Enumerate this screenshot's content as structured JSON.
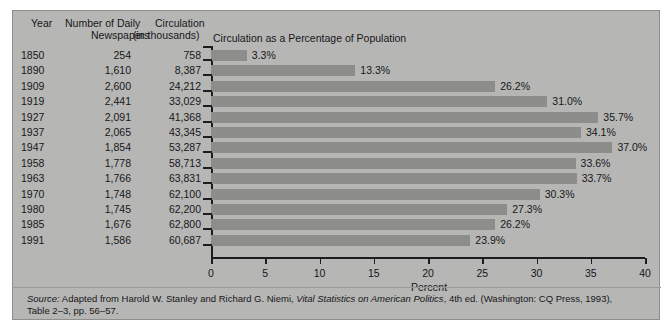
{
  "table": {
    "headers": {
      "year": "Year",
      "newspapers_line1": "Number of Daily",
      "newspapers_line2": "Newspapers",
      "circulation_line1": "Circulation",
      "circulation_line2": "(in thousands)"
    },
    "rows": [
      {
        "year": "1850",
        "newspapers": "254",
        "circulation": "758"
      },
      {
        "year": "1890",
        "newspapers": "1,610",
        "circulation": "8,387"
      },
      {
        "year": "1909",
        "newspapers": "2,600",
        "circulation": "24,212"
      },
      {
        "year": "1919",
        "newspapers": "2,441",
        "circulation": "33,029"
      },
      {
        "year": "1927",
        "newspapers": "2,091",
        "circulation": "41,368"
      },
      {
        "year": "1937",
        "newspapers": "2,065",
        "circulation": "43,345"
      },
      {
        "year": "1947",
        "newspapers": "1,854",
        "circulation": "53,287"
      },
      {
        "year": "1958",
        "newspapers": "1,778",
        "circulation": "58,713"
      },
      {
        "year": "1963",
        "newspapers": "1,766",
        "circulation": "63,831"
      },
      {
        "year": "1970",
        "newspapers": "1,748",
        "circulation": "62,100"
      },
      {
        "year": "1980",
        "newspapers": "1,745",
        "circulation": "62,200"
      },
      {
        "year": "1985",
        "newspapers": "1,676",
        "circulation": "62,800"
      },
      {
        "year": "1991",
        "newspapers": "1,586",
        "circulation": "60,687"
      }
    ]
  },
  "chart_data": {
    "type": "bar",
    "orientation": "horizontal",
    "title": "Circulation as a Percentage of Population",
    "xlabel": "Percent",
    "ylabel": "",
    "xlim": [
      0,
      40
    ],
    "xticks": [
      0,
      5,
      10,
      15,
      20,
      25,
      30,
      35,
      40
    ],
    "xticklabels": [
      "0",
      "5",
      "10",
      "15",
      "20",
      "25",
      "30",
      "35",
      "40"
    ],
    "grid": false,
    "legend": null,
    "bar_color": "#8d8d8b",
    "categories": [
      "1850",
      "1890",
      "1909",
      "1919",
      "1927",
      "1937",
      "1947",
      "1958",
      "1963",
      "1970",
      "1980",
      "1985",
      "1991"
    ],
    "values": [
      3.3,
      13.3,
      26.2,
      31.0,
      35.7,
      34.1,
      37.0,
      33.6,
      33.7,
      30.3,
      27.3,
      26.2,
      23.9
    ],
    "value_labels": [
      "3.3%",
      "13.3%",
      "26.2%",
      "31.0%",
      "35.7%",
      "34.1%",
      "37.0%",
      "33.6%",
      "33.7%",
      "30.3%",
      "27.3%",
      "26.2%",
      "23.9%"
    ]
  },
  "source": {
    "label": "Source:",
    "text_before_italic": " Adapted from Harold W. Stanley and Richard G. Niemi, ",
    "italic_title": "Vital Statistics on American Politics",
    "text_after_italic": ", 4th ed. (Washington: CQ Press, 1993),",
    "line2": "Table 2–3, pp. 56–57."
  }
}
